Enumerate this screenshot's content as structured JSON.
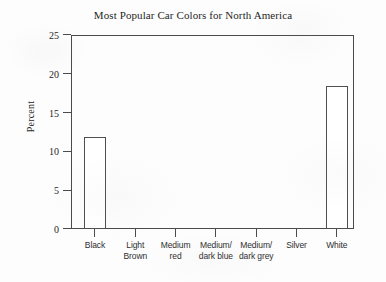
{
  "chart_data": {
    "type": "bar",
    "title": "Most Popular Car Colors for North America",
    "xlabel": "",
    "ylabel": "Percent",
    "ylim": [
      0,
      25
    ],
    "yticks": [
      0,
      5,
      10,
      15,
      20,
      25
    ],
    "grid": false,
    "legend": false,
    "categories": [
      "Black",
      "Light Brown",
      "Medium red",
      "Medium/dark blue",
      "Medium/dark grey",
      "Silver",
      "White"
    ],
    "category_lines": [
      [
        "Black",
        ""
      ],
      [
        "Light",
        "Brown"
      ],
      [
        "Medium",
        "red"
      ],
      [
        "Medium/",
        "dark blue"
      ],
      [
        "Medium/",
        "dark grey"
      ],
      [
        "Silver",
        ""
      ],
      [
        "White",
        ""
      ]
    ],
    "values": [
      11.9,
      0,
      0,
      0,
      0,
      0,
      18.4
    ],
    "bar_style": {
      "fill": "#ffffff",
      "edge": "#4f4f4f"
    }
  },
  "axes": {
    "frame_color": "#4a4a4a",
    "tick_color": "#4a4a4a"
  },
  "figure": {
    "background": "#fdfdfd"
  }
}
